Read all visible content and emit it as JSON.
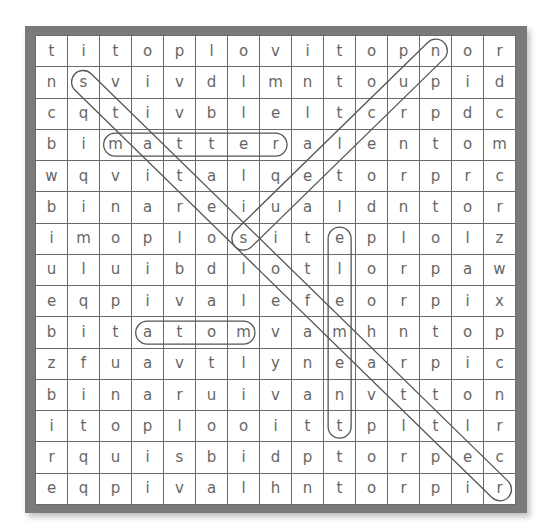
{
  "puzzle": {
    "type": "word-search",
    "rows": 15,
    "cols": 15,
    "grid": [
      [
        "t",
        "i",
        "t",
        "o",
        "p",
        "l",
        "o",
        "v",
        "i",
        "t",
        "o",
        "p",
        "n",
        "o",
        "r"
      ],
      [
        "n",
        "s",
        "v",
        "i",
        "v",
        "d",
        "l",
        "m",
        "n",
        "t",
        "o",
        "u",
        "p",
        "i",
        "d"
      ],
      [
        "c",
        "q",
        "t",
        "i",
        "v",
        "b",
        "l",
        "e",
        "l",
        "t",
        "c",
        "r",
        "p",
        "d",
        "c"
      ],
      [
        "b",
        "i",
        "m",
        "a",
        "t",
        "t",
        "e",
        "r",
        "a",
        "l",
        "e",
        "n",
        "t",
        "o",
        "m"
      ],
      [
        "w",
        "q",
        "v",
        "i",
        "t",
        "a",
        "l",
        "q",
        "e",
        "t",
        "o",
        "r",
        "p",
        "r",
        "c"
      ],
      [
        "b",
        "i",
        "n",
        "a",
        "r",
        "e",
        "i",
        "u",
        "a",
        "l",
        "d",
        "n",
        "t",
        "o",
        "r"
      ],
      [
        "i",
        "m",
        "o",
        "p",
        "l",
        "o",
        "s",
        "i",
        "t",
        "e",
        "p",
        "l",
        "o",
        "l",
        "z"
      ],
      [
        "u",
        "l",
        "u",
        "i",
        "b",
        "d",
        "l",
        "o",
        "t",
        "l",
        "o",
        "r",
        "p",
        "a",
        "w"
      ],
      [
        "e",
        "q",
        "p",
        "i",
        "v",
        "a",
        "l",
        "e",
        "f",
        "e",
        "o",
        "r",
        "p",
        "i",
        "x"
      ],
      [
        "b",
        "i",
        "t",
        "a",
        "t",
        "o",
        "m",
        "v",
        "a",
        "m",
        "h",
        "n",
        "t",
        "o",
        "p"
      ],
      [
        "z",
        "f",
        "u",
        "a",
        "v",
        "t",
        "l",
        "y",
        "n",
        "e",
        "a",
        "r",
        "p",
        "i",
        "c"
      ],
      [
        "b",
        "i",
        "n",
        "a",
        "r",
        "u",
        "i",
        "v",
        "a",
        "n",
        "v",
        "t",
        "t",
        "o",
        "n"
      ],
      [
        "i",
        "t",
        "o",
        "p",
        "l",
        "o",
        "o",
        "i",
        "t",
        "t",
        "p",
        "l",
        "t",
        "l",
        "r"
      ],
      [
        "r",
        "q",
        "u",
        "i",
        "s",
        "b",
        "i",
        "d",
        "p",
        "t",
        "o",
        "r",
        "p",
        "e",
        "c"
      ],
      [
        "e",
        "q",
        "p",
        "i",
        "v",
        "a",
        "l",
        "h",
        "n",
        "t",
        "o",
        "r",
        "p",
        "i",
        "r"
      ]
    ],
    "found_words": [
      {
        "word": "matter",
        "direction": "horizontal",
        "start": [
          3,
          2
        ],
        "end": [
          3,
          7
        ]
      },
      {
        "word": "atom",
        "direction": "horizontal",
        "start": [
          9,
          3
        ],
        "end": [
          9,
          6
        ]
      },
      {
        "word": "element",
        "direction": "vertical",
        "start": [
          6,
          9
        ],
        "end": [
          12,
          9
        ]
      },
      {
        "word": "diagonal-1",
        "direction": "diagonal-down-right",
        "start": [
          1,
          1
        ],
        "end": [
          14,
          14
        ]
      },
      {
        "word": "diagonal-2",
        "direction": "diagonal-down-left",
        "start": [
          0,
          12
        ],
        "end": [
          6,
          6
        ]
      }
    ],
    "colors": {
      "frame": "#7a7a7a",
      "grid_line": "#6b6b6b",
      "letter": "#666666",
      "oval": "#555555"
    }
  }
}
